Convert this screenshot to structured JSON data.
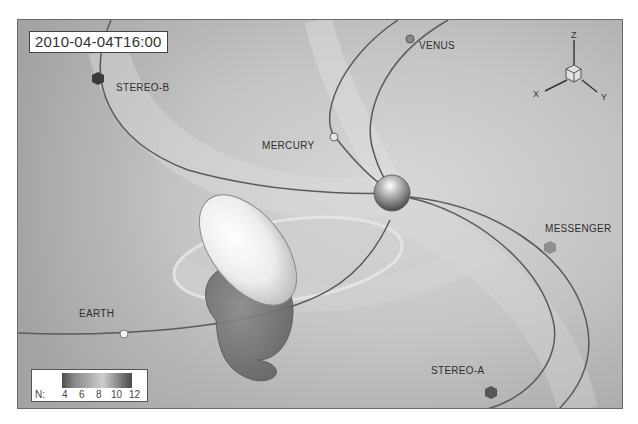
{
  "timestamp": "2010-04-04T16:00",
  "bodies": [
    {
      "id": "stereo-b",
      "label": "STEREO-B",
      "type": "spacecraft"
    },
    {
      "id": "venus",
      "label": "VENUS",
      "type": "planet"
    },
    {
      "id": "mercury",
      "label": "MERCURY",
      "type": "planet"
    },
    {
      "id": "messenger",
      "label": "MESSENGER",
      "type": "spacecraft"
    },
    {
      "id": "earth",
      "label": "EARTH",
      "type": "planet"
    },
    {
      "id": "stereo-a",
      "label": "STEREO-A",
      "type": "spacecraft"
    }
  ],
  "axes": {
    "x": "X",
    "y": "Y",
    "z": "Z"
  },
  "legend": {
    "title": "N:",
    "ticks": [
      "4",
      "6",
      "8",
      "10",
      "12"
    ],
    "colors": {
      "low": "#4e4e4e",
      "mid": "#cfcfcf",
      "high": "#4a4a4a"
    }
  },
  "colors": {
    "background": "#b9b9b9",
    "orbit_line": "#5a5a5a",
    "frame": "#6a6a6a"
  }
}
